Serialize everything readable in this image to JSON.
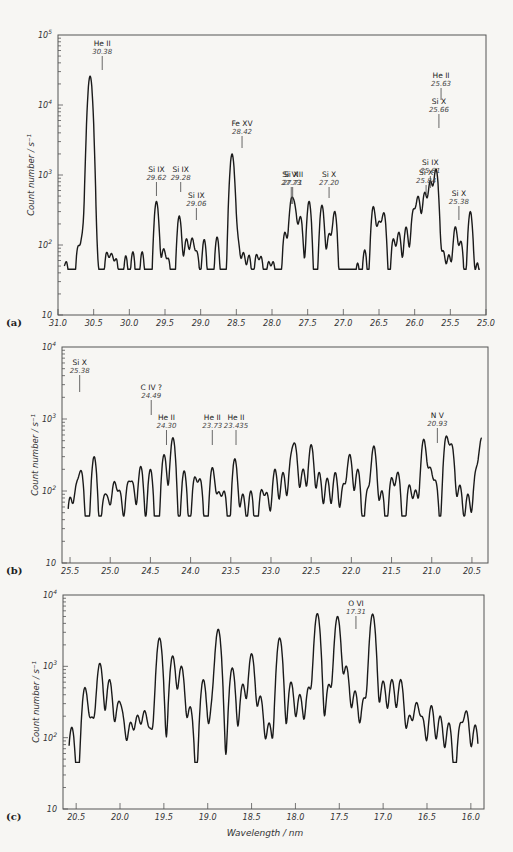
{
  "figure": {
    "x_axis_title": "Wavelength / nm",
    "y_axis_title": "Count number / s⁻¹"
  },
  "chart_data": [
    {
      "type": "line",
      "panel": "(a)",
      "title": "",
      "xlabel": "",
      "ylabel": "Count number / s^-1",
      "yscale": "log",
      "ylim": [
        10,
        100000
      ],
      "xlim": [
        31.0,
        25.0
      ],
      "x_ticks": [
        "31.0",
        "30.5",
        "30.0",
        "29.5",
        "29.0",
        "28.5",
        "28.0",
        "27.5",
        "27.0",
        "26.5",
        "26.0",
        "25.5",
        "25.0"
      ],
      "y_ticks": [
        "10",
        "10^2",
        "10^3",
        "10^4",
        "10^5"
      ],
      "frame": {
        "left": 58,
        "right": 486,
        "top": 35,
        "bottom": 315,
        "decades": 4
      },
      "annotations": [
        {
          "ion": "He II",
          "wavelength": "30.38",
          "x": 30.38,
          "y_text": 46,
          "line": [
            56,
            70
          ]
        },
        {
          "ion": "Si IX",
          "wavelength": "29.62",
          "x": 29.62,
          "y_text": 172,
          "line": [
            182,
            196
          ]
        },
        {
          "ion": "Si IX",
          "wavelength": "29.28",
          "x": 29.28,
          "y_text": 172,
          "line": [
            182,
            192
          ]
        },
        {
          "ion": "Si IX",
          "wavelength": "29.06",
          "x": 29.06,
          "y_text": 198,
          "line": [
            208,
            220
          ]
        },
        {
          "ion": "Fe XV",
          "wavelength": "28.42",
          "x": 28.42,
          "y_text": 126,
          "line": [
            136,
            148
          ]
        },
        {
          "ion": "Si X",
          "wavelength": "27.73",
          "x": 27.73,
          "y_text": 177,
          "line": [
            187,
            204
          ]
        },
        {
          "ion": "Si VIII",
          "wavelength": "27.71",
          "x": 27.71,
          "y_text": 177,
          "line": [
            187,
            204
          ]
        },
        {
          "ion": "Si X",
          "wavelength": "27.20",
          "x": 27.2,
          "y_text": 177,
          "line": [
            187,
            198
          ]
        },
        {
          "ion": "Si X",
          "wavelength": "25.84",
          "x": 25.84,
          "y_text": 175,
          "line": [
            185,
            195
          ]
        },
        {
          "ion": "Si IX",
          "wavelength": "25.81",
          "x": 25.78,
          "y_text": 165,
          "line": [
            176,
            188
          ]
        },
        {
          "ion": "Si X",
          "wavelength": "25.66",
          "x": 25.66,
          "y_text": 104,
          "line": [
            114,
            128
          ]
        },
        {
          "ion": "He II",
          "wavelength": "25.63",
          "x": 25.63,
          "y_text": 78,
          "line": [
            88,
            100
          ]
        },
        {
          "ion": "Si X",
          "wavelength": "25.38",
          "x": 25.38,
          "y_text": 196,
          "line": [
            206,
            220
          ]
        }
      ],
      "peaks": [
        [
          30.95,
          55
        ],
        [
          30.88,
          55
        ],
        [
          30.72,
          90
        ],
        [
          30.65,
          140
        ],
        [
          30.55,
          26000
        ],
        [
          30.45,
          55
        ],
        [
          30.32,
          75
        ],
        [
          30.25,
          70
        ],
        [
          30.18,
          60
        ],
        [
          30.05,
          70
        ],
        [
          29.95,
          80
        ],
        [
          29.82,
          80
        ],
        [
          29.62,
          420
        ],
        [
          29.52,
          85
        ],
        [
          29.45,
          60
        ],
        [
          29.3,
          260
        ],
        [
          29.2,
          120
        ],
        [
          29.12,
          120
        ],
        [
          29.05,
          75
        ],
        [
          28.95,
          120
        ],
        [
          28.77,
          130
        ],
        [
          28.56,
          2000
        ],
        [
          28.48,
          110
        ],
        [
          28.4,
          75
        ],
        [
          28.32,
          70
        ],
        [
          28.22,
          70
        ],
        [
          28.15,
          65
        ],
        [
          28.05,
          55
        ],
        [
          27.98,
          55
        ],
        [
          27.82,
          150
        ],
        [
          27.73,
          400
        ],
        [
          27.68,
          300
        ],
        [
          27.6,
          250
        ],
        [
          27.48,
          420
        ],
        [
          27.3,
          370
        ],
        [
          27.2,
          140
        ],
        [
          27.12,
          300
        ],
        [
          26.8,
          55
        ],
        [
          26.7,
          85
        ],
        [
          26.58,
          350
        ],
        [
          26.5,
          200
        ],
        [
          26.43,
          280
        ],
        [
          26.3,
          120
        ],
        [
          26.22,
          150
        ],
        [
          26.12,
          180
        ],
        [
          26.02,
          300
        ],
        [
          25.95,
          480
        ],
        [
          25.86,
          550
        ],
        [
          25.78,
          800
        ],
        [
          25.7,
          1200
        ],
        [
          25.6,
          80
        ],
        [
          25.52,
          70
        ],
        [
          25.43,
          180
        ],
        [
          25.35,
          110
        ],
        [
          25.22,
          300
        ],
        [
          25.12,
          55
        ]
      ]
    },
    {
      "type": "line",
      "panel": "(b)",
      "yscale": "log",
      "ylim": [
        10,
        10000
      ],
      "xlim": [
        25.6,
        20.3
      ],
      "x_ticks": [
        "25.5",
        "25.0",
        "24.5",
        "24.0",
        "23.5",
        "23.0",
        "22.5",
        "22.0",
        "21.5",
        "21.0",
        "20.5"
      ],
      "y_ticks": [
        "10",
        "10^2",
        "10^3",
        "10^4"
      ],
      "frame": {
        "left": 62,
        "right": 488,
        "top": 347,
        "bottom": 563,
        "decades": 3
      },
      "annotations": [
        {
          "ion": "Si X",
          "wavelength": "25.38",
          "x": 25.38,
          "y_text": 365,
          "line": [
            375,
            392
          ]
        },
        {
          "ion": "C IV ?",
          "wavelength": "24.49",
          "x": 24.49,
          "y_text": 390,
          "line": [
            400,
            415
          ]
        },
        {
          "ion": "He II",
          "wavelength": "24.30",
          "x": 24.3,
          "y_text": 420,
          "line": [
            430,
            445
          ]
        },
        {
          "ion": "He II",
          "wavelength": "23.73",
          "x": 23.73,
          "y_text": 420,
          "line": [
            430,
            445
          ]
        },
        {
          "ion": "He II",
          "wavelength": "23.435",
          "x": 23.435,
          "y_text": 420,
          "line": [
            430,
            445
          ]
        },
        {
          "ion": "N V",
          "wavelength": "20.93",
          "x": 20.93,
          "y_text": 418,
          "line": [
            428,
            443
          ]
        }
      ],
      "peaks": [
        [
          25.5,
          80
        ],
        [
          25.42,
          110
        ],
        [
          25.36,
          180
        ],
        [
          25.2,
          300
        ],
        [
          25.08,
          70
        ],
        [
          25.03,
          65
        ],
        [
          24.95,
          130
        ],
        [
          24.88,
          95
        ],
        [
          24.78,
          120
        ],
        [
          24.72,
          120
        ],
        [
          24.62,
          220
        ],
        [
          24.5,
          200
        ],
        [
          24.33,
          320
        ],
        [
          24.22,
          550
        ],
        [
          24.08,
          190
        ],
        [
          23.95,
          150
        ],
        [
          23.88,
          140
        ],
        [
          23.73,
          210
        ],
        [
          23.65,
          90
        ],
        [
          23.58,
          95
        ],
        [
          23.45,
          280
        ],
        [
          23.35,
          90
        ],
        [
          23.25,
          100
        ],
        [
          23.12,
          100
        ],
        [
          23.05,
          90
        ],
        [
          22.95,
          200
        ],
        [
          22.85,
          180
        ],
        [
          22.75,
          250
        ],
        [
          22.7,
          400
        ],
        [
          22.6,
          200
        ],
        [
          22.5,
          440
        ],
        [
          22.4,
          180
        ],
        [
          22.3,
          150
        ],
        [
          22.2,
          180
        ],
        [
          22.1,
          120
        ],
        [
          22.02,
          320
        ],
        [
          21.92,
          200
        ],
        [
          21.8,
          100
        ],
        [
          21.72,
          420
        ],
        [
          21.62,
          100
        ],
        [
          21.5,
          150
        ],
        [
          21.42,
          180
        ],
        [
          21.28,
          120
        ],
        [
          21.2,
          100
        ],
        [
          21.1,
          520
        ],
        [
          21.02,
          200
        ],
        [
          20.95,
          130
        ],
        [
          20.82,
          560
        ],
        [
          20.75,
          420
        ],
        [
          20.65,
          120
        ],
        [
          20.55,
          90
        ],
        [
          20.45,
          180
        ],
        [
          20.38,
          520
        ],
        [
          20.32,
          180
        ]
      ]
    },
    {
      "type": "line",
      "panel": "(c)",
      "yscale": "log",
      "ylim": [
        10,
        10000
      ],
      "xlim": [
        20.65,
        15.85
      ],
      "x_ticks": [
        "20.5",
        "20.0",
        "19.5",
        "19.0",
        "18.5",
        "18.0",
        "17.5",
        "17.0",
        "16.5",
        "16.0"
      ],
      "y_ticks": [
        "10",
        "10^2",
        "10^3",
        "10^4"
      ],
      "frame": {
        "left": 63,
        "right": 484,
        "top": 595,
        "bottom": 809,
        "decades": 3
      },
      "annotations": [
        {
          "ion": "O VI",
          "wavelength": "17.31",
          "x": 17.31,
          "y_text": 606,
          "line": [
            616,
            629
          ]
        }
      ],
      "peaks": [
        [
          20.55,
          140
        ],
        [
          20.4,
          500
        ],
        [
          20.32,
          180
        ],
        [
          20.23,
          1100
        ],
        [
          20.12,
          650
        ],
        [
          20.02,
          280
        ],
        [
          19.97,
          170
        ],
        [
          19.88,
          160
        ],
        [
          19.8,
          200
        ],
        [
          19.72,
          230
        ],
        [
          19.65,
          120
        ],
        [
          19.55,
          2500
        ],
        [
          19.4,
          1400
        ],
        [
          19.3,
          1000
        ],
        [
          19.2,
          270
        ],
        [
          19.05,
          650
        ],
        [
          18.95,
          250
        ],
        [
          18.88,
          3300
        ],
        [
          18.72,
          950
        ],
        [
          18.6,
          560
        ],
        [
          18.5,
          1500
        ],
        [
          18.4,
          380
        ],
        [
          18.3,
          160
        ],
        [
          18.18,
          2500
        ],
        [
          18.05,
          600
        ],
        [
          17.95,
          400
        ],
        [
          17.85,
          500
        ],
        [
          17.75,
          5500
        ],
        [
          17.62,
          550
        ],
        [
          17.52,
          5000
        ],
        [
          17.42,
          1000
        ],
        [
          17.32,
          450
        ],
        [
          17.22,
          350
        ],
        [
          17.12,
          5400
        ],
        [
          17.0,
          620
        ],
        [
          16.9,
          650
        ],
        [
          16.8,
          650
        ],
        [
          16.7,
          200
        ],
        [
          16.62,
          300
        ],
        [
          16.55,
          180
        ],
        [
          16.45,
          280
        ],
        [
          16.35,
          200
        ],
        [
          16.25,
          160
        ],
        [
          16.12,
          150
        ],
        [
          16.05,
          230
        ],
        [
          15.95,
          150
        ]
      ]
    }
  ]
}
